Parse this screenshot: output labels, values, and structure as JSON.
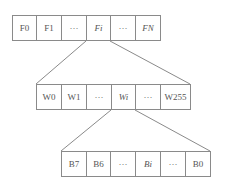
{
  "diagram": {
    "file_row": {
      "cells": [
        {
          "label": "F0"
        },
        {
          "label": "F1"
        },
        {
          "label": "···"
        },
        {
          "label": "Fi"
        },
        {
          "label": "···"
        },
        {
          "label": "FN"
        }
      ]
    },
    "word_row": {
      "cells": [
        {
          "label": "W0"
        },
        {
          "label": "W1"
        },
        {
          "label": "···"
        },
        {
          "label": "Wi"
        },
        {
          "label": "···"
        },
        {
          "label": "W255"
        }
      ]
    },
    "bit_row": {
      "cells": [
        {
          "label": "B7"
        },
        {
          "label": "B6"
        },
        {
          "label": "···"
        },
        {
          "label": "Bi"
        },
        {
          "label": "···"
        },
        {
          "label": "B0"
        }
      ]
    },
    "colors": {
      "line": "#8a8a8a",
      "text": "#555555"
    }
  }
}
